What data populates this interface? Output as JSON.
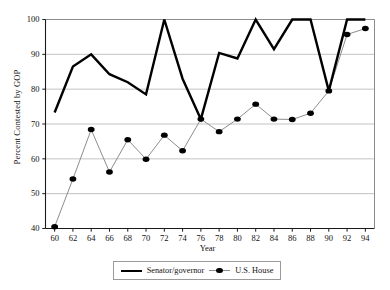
{
  "chart_data": {
    "type": "line",
    "title": "",
    "xlabel": "Year",
    "ylabel": "Percent Contested by GOP",
    "x": [
      60,
      62,
      64,
      66,
      68,
      70,
      72,
      74,
      76,
      78,
      80,
      82,
      84,
      86,
      88,
      90,
      92,
      94
    ],
    "xtick_labels": [
      "60",
      "62",
      "64",
      "66",
      "68",
      "70",
      "72",
      "74",
      "76",
      "78",
      "80",
      "82",
      "84",
      "86",
      "88",
      "90",
      "92",
      "94"
    ],
    "ytick_labels": [
      "40",
      "50",
      "60",
      "70",
      "80",
      "90",
      "100"
    ],
    "yticks": [
      40,
      50,
      60,
      70,
      80,
      90,
      100
    ],
    "xlim": [
      59,
      95
    ],
    "ylim": [
      40,
      100
    ],
    "grid": "horizontal",
    "legend_position": "bottom-center",
    "series": [
      {
        "name": "Senator/governor",
        "marker": "none",
        "color": "#000000",
        "linewidth": 2.4,
        "values": [
          73.3,
          86.5,
          90.0,
          84.3,
          82.0,
          78.5,
          100.0,
          83.0,
          71.4,
          90.4,
          88.8,
          100.0,
          91.5,
          100.0,
          100.0,
          79.5,
          100.0,
          100.0
        ]
      },
      {
        "name": "U.S. House",
        "marker": "filled-circle",
        "color": "#8d8d8d",
        "marker_color": "#000000",
        "linewidth": 1.0,
        "values": [
          40.5,
          54.2,
          68.4,
          56.2,
          65.5,
          59.9,
          66.8,
          62.3,
          71.4,
          67.8,
          71.4,
          75.7,
          71.4,
          71.3,
          73.1,
          79.5,
          95.7,
          97.4
        ]
      }
    ]
  },
  "legend": {
    "items": [
      {
        "label": "Senator/governor",
        "style": "line"
      },
      {
        "label": "U.S. House",
        "style": "line-marker"
      }
    ]
  }
}
